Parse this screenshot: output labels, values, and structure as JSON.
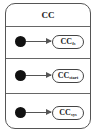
{
  "diagram": {
    "title": "CC",
    "regions": [
      {
        "state": "CC",
        "subscript": "fs"
      },
      {
        "state": "CC",
        "subscript": "start"
      },
      {
        "state": "CC",
        "subscript": "sys"
      }
    ]
  }
}
